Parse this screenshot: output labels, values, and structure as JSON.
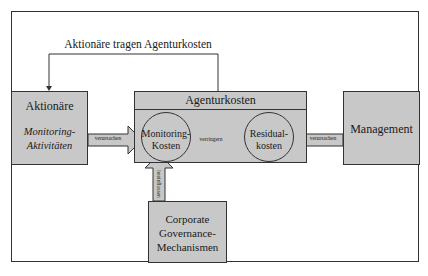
{
  "diagram": {
    "top_label": "Aktionäre tragen Agenturkosten",
    "nodes": {
      "aktionaere": {
        "title": "Aktionäre",
        "subtitle_line1": "Monitoring-",
        "subtitle_line2": "Aktivitäten"
      },
      "agenturkosten": {
        "title": "Agenturkosten"
      },
      "monitoring_kosten": {
        "line1": "Monitoring-",
        "line2": "Kosten"
      },
      "residual_kosten": {
        "line1": "Residual-",
        "line2": "kosten"
      },
      "management": {
        "title": "Management"
      },
      "corporate_governance": {
        "line1": "Corporate",
        "line2": "Governance-",
        "line3": "Mechanismen"
      }
    },
    "edges": {
      "aktionaere_to_monitoring": "verursachen",
      "monitoring_to_residual": "verringern",
      "management_to_residual": "verursachen",
      "governance_to_monitoring": "beeinflussen"
    },
    "colors": {
      "box_fill": "#c8c8c8",
      "stroke": "#333333",
      "background": "#ffffff"
    }
  }
}
